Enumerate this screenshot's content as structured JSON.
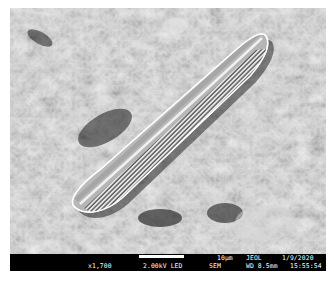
{
  "image": {
    "subject": "diatom frustule on rough substrate",
    "modality": "scanning electron micrograph",
    "palette": {
      "background": "#ffffff",
      "info_bar": "#000000",
      "info_text": "#ffffff"
    }
  },
  "info_bar": {
    "scale_label": "10µm",
    "manufacturer": "JEOL",
    "date": "1/9/2020",
    "magnification": "x1,700",
    "voltage": "2.00kV LED",
    "mode": "SEM",
    "working_distance": "WD 8.5mm",
    "time": "15:55:54"
  }
}
